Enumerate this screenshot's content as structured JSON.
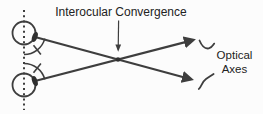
{
  "diagram": {
    "title_label": "Interocular Convergence",
    "axes_label": [
      "Optical",
      "Axes"
    ],
    "colors": {
      "line": "#3e3e3e",
      "text": "#222222",
      "background": "#fcfcfc"
    },
    "marks": {
      "axis_arrowheads": "right-pointing-arrowhead",
      "label_pointer": "down-arrow",
      "axes_leader_marks": "s-curve-squiggle",
      "angle_marks": "arc-with-tick",
      "eyes": "circle-with-dark-lens",
      "midline": "vertical-dotted-line"
    }
  }
}
